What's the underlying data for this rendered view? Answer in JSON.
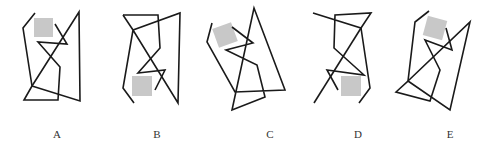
{
  "figure": {
    "stroke_color": "#1a1a1a",
    "shade_color": "#c8c8c8",
    "options": [
      {
        "label": "A",
        "label_x": 57,
        "paths": [
          "35,13 23,28 32,86 24,100 58,100 60,67 38,42 67,44 55,24",
          "32,86 79,12 80,101 32,86"
        ],
        "square": {
          "x": 34,
          "y": 18,
          "w": 19,
          "h": 19,
          "rotate": 0
        }
      },
      {
        "label": "B",
        "label_x": 157,
        "paths": [
          "123,15 158,15 160,48 138,73 165,70 155,90",
          "123,15 133,30 180,13 178,103 133,30 123,88 134,103"
        ],
        "square": {
          "x": 132,
          "y": 76,
          "w": 20,
          "h": 20,
          "rotate": 0
        }
      },
      {
        "label": "C",
        "label_x": 270,
        "paths": [
          "212,23 207,42 235,92 285,90 254,8 232,110 265,97 257,65 226,50 253,43 232,27"
        ],
        "square": {
          "x": 215,
          "y": 25,
          "w": 20,
          "h": 20,
          "rotate": -20
        }
      },
      {
        "label": "D",
        "label_x": 358,
        "paths": [
          "313,13 361,28 371,13 335,15 334,48 364,75 327,70 338,90",
          "361,28 314,103",
          "361,28 370,88 359,103"
        ],
        "square": {
          "x": 341,
          "y": 76,
          "w": 20,
          "h": 20,
          "rotate": 0
        }
      },
      {
        "label": "E",
        "label_x": 450,
        "paths": [
          "429,11 415,22 408,81 396,92 430,101 440,70 425,40 452,50 446,28",
          "408,81 470,22 450,110 408,81"
        ],
        "square": {
          "x": 425,
          "y": 18,
          "w": 20,
          "h": 20,
          "rotate": 15
        }
      }
    ]
  }
}
